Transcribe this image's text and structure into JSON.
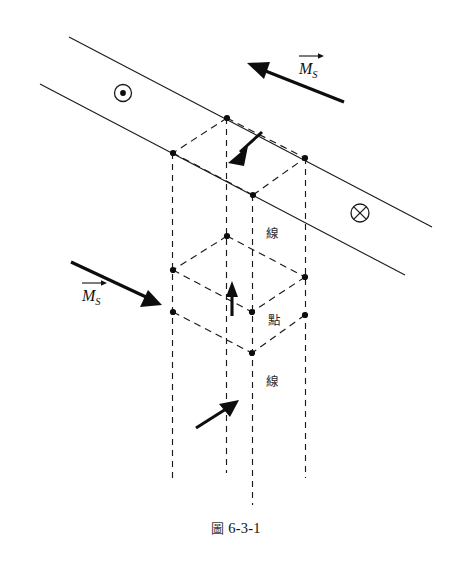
{
  "figure": {
    "caption_marker": "圖",
    "caption_number": "6-3-1",
    "caption_full": "圖 6-3-1"
  },
  "labels": {
    "ms_top": {
      "symbol": "M",
      "subscript": "S",
      "vector": true,
      "text": "M_S"
    },
    "ms_left": {
      "symbol": "M",
      "subscript": "S",
      "vector": true,
      "text": "M_S"
    },
    "line_upper": "線",
    "point_middle": "點",
    "line_lower": "線"
  },
  "symbols": {
    "out_of_page": {
      "name": "circle-dot",
      "glyph": "⊙",
      "cx": 123,
      "cy": 93,
      "r": 8.5
    },
    "into_page": {
      "name": "circle-cross",
      "glyph": "⊗",
      "cx": 360,
      "cy": 213,
      "r": 9
    }
  },
  "colors": {
    "ink": "#1a1a1a",
    "node": "#0d0d0d",
    "background": "#ffffff",
    "label": "#2b2b2b"
  },
  "geometry": {
    "band": {
      "upper_line": {
        "x1": 69,
        "y1": 37,
        "x2": 432,
        "y2": 227
      },
      "lower_line": {
        "x1": 40,
        "y1": 84,
        "x2": 405,
        "y2": 275
      }
    },
    "vertical_dashed_lines": [
      {
        "x": 172,
        "y1": 153,
        "y2": 482
      },
      {
        "x": 226,
        "y1": 118,
        "y2": 473
      },
      {
        "x": 252,
        "y1": 195,
        "y2": 505
      },
      {
        "x": 305,
        "y1": 158,
        "y2": 478
      }
    ],
    "upper_cell_vertices": [
      {
        "x": 227,
        "y": 118
      },
      {
        "x": 173,
        "y": 153
      },
      {
        "x": 305,
        "y": 158
      },
      {
        "x": 253,
        "y": 195
      }
    ],
    "lower_cell_vertices": [
      {
        "x": 227,
        "y": 236
      },
      {
        "x": 173,
        "y": 270
      },
      {
        "x": 305,
        "y": 277
      },
      {
        "x": 173,
        "y": 312
      },
      {
        "x": 252,
        "y": 312
      },
      {
        "x": 305,
        "y": 315
      },
      {
        "x": 252,
        "y": 353
      }
    ]
  },
  "arrows": {
    "ms_top_arrow": {
      "x1": 344,
      "y1": 102,
      "x2": 249,
      "y2": 64,
      "direction": "upper-left"
    },
    "ms_left_arrow": {
      "x1": 71,
      "y1": 262,
      "x2": 158,
      "y2": 303,
      "direction": "lower-right"
    },
    "moment_down": {
      "x1": 258,
      "y1": 135,
      "x2": 232,
      "y2": 159,
      "direction": "lower-left"
    },
    "moment_up": {
      "x1": 232,
      "y1": 315,
      "x2": 232,
      "y2": 283,
      "direction": "up"
    },
    "moment_up_right": {
      "x1": 197,
      "y1": 428,
      "x2": 235,
      "y2": 402,
      "direction": "upper-right"
    }
  }
}
